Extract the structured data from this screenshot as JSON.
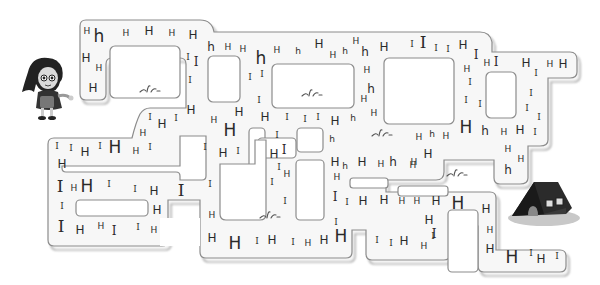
{
  "puzzle": {
    "type": "letter-maze",
    "start": "girl",
    "goal": "house",
    "path_letter": "H",
    "distractor_letters": [
      "h",
      "I"
    ]
  },
  "colors": {
    "corridor_fill": "#f8f8f8",
    "corridor_edge": "#8a8a8a",
    "shadow": "#b9b9b9",
    "letter": "#2a2a2a"
  },
  "letters": [
    {
      "c": "H",
      "x": 87,
      "y": 31,
      "s": "s"
    },
    {
      "c": "h",
      "x": 99,
      "y": 36,
      "s": "l",
      "t": "lower"
    },
    {
      "c": "H",
      "x": 126,
      "y": 33,
      "s": "s"
    },
    {
      "c": "H",
      "x": 149,
      "y": 31,
      "s": "m"
    },
    {
      "c": "H",
      "x": 172,
      "y": 33,
      "s": "s"
    },
    {
      "c": "H",
      "x": 193,
      "y": 35,
      "s": "m"
    },
    {
      "c": "H",
      "x": 86,
      "y": 58,
      "s": "m"
    },
    {
      "c": "H",
      "x": 99,
      "y": 68,
      "s": "s"
    },
    {
      "c": "H",
      "x": 93,
      "y": 88,
      "s": "m"
    },
    {
      "c": "I",
      "x": 188,
      "y": 57,
      "s": "s",
      "t": "serif"
    },
    {
      "c": "I",
      "x": 196,
      "y": 62,
      "s": "m",
      "t": "serif"
    },
    {
      "c": "I",
      "x": 190,
      "y": 80,
      "s": "s",
      "t": "serif"
    },
    {
      "c": "H",
      "x": 191,
      "y": 110,
      "s": "m"
    },
    {
      "c": "I",
      "x": 150,
      "y": 117,
      "s": "s",
      "t": "serif"
    },
    {
      "c": "H",
      "x": 162,
      "y": 124,
      "s": "m"
    },
    {
      "c": "I",
      "x": 176,
      "y": 118,
      "s": "s",
      "t": "serif"
    },
    {
      "c": "H",
      "x": 143,
      "y": 133,
      "s": "s"
    },
    {
      "c": "h",
      "x": 211,
      "y": 47,
      "s": "m",
      "t": "lower"
    },
    {
      "c": "H",
      "x": 228,
      "y": 47,
      "s": "s"
    },
    {
      "c": "H",
      "x": 243,
      "y": 49,
      "s": "s"
    },
    {
      "c": "h",
      "x": 261,
      "y": 58,
      "s": "l",
      "t": "lower"
    },
    {
      "c": "H",
      "x": 277,
      "y": 50,
      "s": "s"
    },
    {
      "c": "h",
      "x": 298,
      "y": 51,
      "s": "s",
      "t": "lower"
    },
    {
      "c": "H",
      "x": 319,
      "y": 44,
      "s": "m"
    },
    {
      "c": "H",
      "x": 333,
      "y": 55,
      "s": "s"
    },
    {
      "c": "h",
      "x": 345,
      "y": 51,
      "s": "s",
      "t": "lower"
    },
    {
      "c": "H",
      "x": 356,
      "y": 41,
      "s": "s"
    },
    {
      "c": "h",
      "x": 365,
      "y": 52,
      "s": "m",
      "t": "lower"
    },
    {
      "c": "H",
      "x": 384,
      "y": 47,
      "s": "m"
    },
    {
      "c": "I",
      "x": 250,
      "y": 77,
      "s": "s",
      "t": "serif"
    },
    {
      "c": "I",
      "x": 262,
      "y": 74,
      "s": "s",
      "t": "serif"
    },
    {
      "c": "I",
      "x": 259,
      "y": 100,
      "s": "s",
      "t": "serif"
    },
    {
      "c": "H",
      "x": 367,
      "y": 70,
      "s": "s"
    },
    {
      "c": "h",
      "x": 371,
      "y": 89,
      "s": "m",
      "t": "lower"
    },
    {
      "c": "H",
      "x": 364,
      "y": 99,
      "s": "s"
    },
    {
      "c": "H",
      "x": 374,
      "y": 113,
      "s": "s"
    },
    {
      "c": "H",
      "x": 214,
      "y": 120,
      "s": "s"
    },
    {
      "c": "H",
      "x": 239,
      "y": 112,
      "s": "m"
    },
    {
      "c": "H",
      "x": 265,
      "y": 117,
      "s": "m"
    },
    {
      "c": "I",
      "x": 287,
      "y": 117,
      "s": "s",
      "t": "serif"
    },
    {
      "c": "I",
      "x": 305,
      "y": 119,
      "s": "s",
      "t": "serif"
    },
    {
      "c": "I",
      "x": 318,
      "y": 117,
      "s": "s",
      "t": "serif"
    },
    {
      "c": "H",
      "x": 335,
      "y": 121,
      "s": "m"
    },
    {
      "c": "h",
      "x": 353,
      "y": 118,
      "s": "s",
      "t": "lower"
    },
    {
      "c": "H",
      "x": 230,
      "y": 130,
      "s": "l"
    },
    {
      "c": "I",
      "x": 277,
      "y": 135,
      "s": "s",
      "t": "serif"
    },
    {
      "c": "h",
      "x": 332,
      "y": 139,
      "s": "s",
      "t": "lower"
    },
    {
      "c": "I",
      "x": 412,
      "y": 44,
      "s": "s",
      "t": "serif"
    },
    {
      "c": "I",
      "x": 423,
      "y": 42,
      "s": "l",
      "t": "serif"
    },
    {
      "c": "I",
      "x": 436,
      "y": 48,
      "s": "s",
      "t": "serif"
    },
    {
      "c": "I",
      "x": 448,
      "y": 49,
      "s": "s",
      "t": "serif"
    },
    {
      "c": "H",
      "x": 463,
      "y": 45,
      "s": "m"
    },
    {
      "c": "I",
      "x": 476,
      "y": 55,
      "s": "m",
      "t": "serif"
    },
    {
      "c": "H",
      "x": 467,
      "y": 69,
      "s": "s"
    },
    {
      "c": "H",
      "x": 487,
      "y": 63,
      "s": "s"
    },
    {
      "c": "I",
      "x": 496,
      "y": 62,
      "s": "m",
      "t": "serif"
    },
    {
      "c": "I",
      "x": 470,
      "y": 82,
      "s": "s",
      "t": "serif"
    },
    {
      "c": "I",
      "x": 466,
      "y": 100,
      "s": "s",
      "t": "serif"
    },
    {
      "c": "I",
      "x": 480,
      "y": 104,
      "s": "s",
      "t": "serif"
    },
    {
      "c": "H",
      "x": 526,
      "y": 63,
      "s": "m"
    },
    {
      "c": "I",
      "x": 536,
      "y": 73,
      "s": "s",
      "t": "serif"
    },
    {
      "c": "H",
      "x": 550,
      "y": 64,
      "s": "s"
    },
    {
      "c": "H",
      "x": 563,
      "y": 64,
      "s": "m"
    },
    {
      "c": "I",
      "x": 531,
      "y": 93,
      "s": "s",
      "t": "serif"
    },
    {
      "c": "I",
      "x": 527,
      "y": 108,
      "s": "s",
      "t": "serif"
    },
    {
      "c": "I",
      "x": 539,
      "y": 117,
      "s": "s",
      "t": "serif"
    },
    {
      "c": "H",
      "x": 466,
      "y": 127,
      "s": "l"
    },
    {
      "c": "h",
      "x": 485,
      "y": 131,
      "s": "m",
      "t": "lower"
    },
    {
      "c": "H",
      "x": 504,
      "y": 132,
      "s": "s"
    },
    {
      "c": "H",
      "x": 520,
      "y": 130,
      "s": "m"
    },
    {
      "c": "I",
      "x": 535,
      "y": 132,
      "s": "s",
      "t": "serif"
    },
    {
      "c": "H",
      "x": 419,
      "y": 137,
      "s": "s"
    },
    {
      "c": "h",
      "x": 432,
      "y": 134,
      "s": "s",
      "t": "lower"
    },
    {
      "c": "H",
      "x": 446,
      "y": 136,
      "s": "s"
    },
    {
      "c": "H",
      "x": 508,
      "y": 149,
      "s": "s"
    },
    {
      "c": "H",
      "x": 521,
      "y": 159,
      "s": "s"
    },
    {
      "c": "h",
      "x": 508,
      "y": 170,
      "s": "m",
      "t": "lower"
    },
    {
      "c": "I",
      "x": 57,
      "y": 146,
      "s": "s",
      "t": "serif"
    },
    {
      "c": "I",
      "x": 71,
      "y": 148,
      "s": "s",
      "t": "serif"
    },
    {
      "c": "H",
      "x": 85,
      "y": 152,
      "s": "m"
    },
    {
      "c": "I",
      "x": 100,
      "y": 146,
      "s": "s",
      "t": "serif"
    },
    {
      "c": "H",
      "x": 115,
      "y": 147,
      "s": "l"
    },
    {
      "c": "H",
      "x": 136,
      "y": 151,
      "s": "s"
    },
    {
      "c": "I",
      "x": 150,
      "y": 147,
      "s": "s",
      "t": "serif"
    },
    {
      "c": "H",
      "x": 62,
      "y": 164,
      "s": "m"
    },
    {
      "c": "I",
      "x": 60,
      "y": 186,
      "s": "l",
      "t": "serif"
    },
    {
      "c": "H",
      "x": 74,
      "y": 188,
      "s": "s"
    },
    {
      "c": "H",
      "x": 87,
      "y": 186,
      "s": "l"
    },
    {
      "c": "I",
      "x": 109,
      "y": 184,
      "s": "s",
      "t": "serif"
    },
    {
      "c": "I",
      "x": 135,
      "y": 189,
      "s": "s",
      "t": "serif"
    },
    {
      "c": "H",
      "x": 154,
      "y": 191,
      "s": "m"
    },
    {
      "c": "I",
      "x": 181,
      "y": 190,
      "s": "l",
      "t": "serif"
    },
    {
      "c": "I",
      "x": 62,
      "y": 206,
      "s": "s",
      "t": "serif"
    },
    {
      "c": "H",
      "x": 157,
      "y": 210,
      "s": "m"
    },
    {
      "c": "I",
      "x": 61,
      "y": 226,
      "s": "l",
      "t": "serif"
    },
    {
      "c": "H",
      "x": 80,
      "y": 230,
      "s": "m"
    },
    {
      "c": "H",
      "x": 101,
      "y": 226,
      "s": "s"
    },
    {
      "c": "I",
      "x": 114,
      "y": 231,
      "s": "m",
      "t": "serif"
    },
    {
      "c": "I",
      "x": 138,
      "y": 227,
      "s": "s",
      "t": "serif"
    },
    {
      "c": "H",
      "x": 154,
      "y": 230,
      "s": "s"
    },
    {
      "c": "I",
      "x": 205,
      "y": 147,
      "s": "s",
      "t": "serif"
    },
    {
      "c": "I",
      "x": 210,
      "y": 184,
      "s": "s",
      "t": "serif"
    },
    {
      "c": "H",
      "x": 223,
      "y": 153,
      "s": "m"
    },
    {
      "c": "I",
      "x": 238,
      "y": 151,
      "s": "s",
      "t": "serif"
    },
    {
      "c": "H",
      "x": 274,
      "y": 154,
      "s": "m"
    },
    {
      "c": "I",
      "x": 284,
      "y": 150,
      "s": "m",
      "t": "serif"
    },
    {
      "c": "I",
      "x": 279,
      "y": 167,
      "s": "s",
      "t": "serif"
    },
    {
      "c": "H",
      "x": 287,
      "y": 174,
      "s": "s"
    },
    {
      "c": "I",
      "x": 272,
      "y": 182,
      "s": "s",
      "t": "serif"
    },
    {
      "c": "I",
      "x": 285,
      "y": 201,
      "s": "s",
      "t": "serif"
    },
    {
      "c": "H",
      "x": 212,
      "y": 215,
      "s": "s"
    },
    {
      "c": "H",
      "x": 212,
      "y": 238,
      "s": "m"
    },
    {
      "c": "H",
      "x": 235,
      "y": 243,
      "s": "l"
    },
    {
      "c": "I",
      "x": 257,
      "y": 241,
      "s": "s",
      "t": "serif"
    },
    {
      "c": "H",
      "x": 272,
      "y": 240,
      "s": "m"
    },
    {
      "c": "I",
      "x": 293,
      "y": 242,
      "s": "s",
      "t": "serif"
    },
    {
      "c": "H",
      "x": 308,
      "y": 243,
      "s": "s"
    },
    {
      "c": "H",
      "x": 324,
      "y": 240,
      "s": "m"
    },
    {
      "c": "H",
      "x": 341,
      "y": 236,
      "s": "l"
    },
    {
      "c": "I",
      "x": 336,
      "y": 222,
      "s": "s",
      "t": "serif"
    },
    {
      "c": "I",
      "x": 335,
      "y": 197,
      "s": "m",
      "t": "serif"
    },
    {
      "c": "I",
      "x": 347,
      "y": 202,
      "s": "s",
      "t": "serif"
    },
    {
      "c": "H",
      "x": 363,
      "y": 201,
      "s": "m"
    },
    {
      "c": "H",
      "x": 384,
      "y": 200,
      "s": "m"
    },
    {
      "c": "H",
      "x": 337,
      "y": 177,
      "s": "s"
    },
    {
      "c": "H",
      "x": 335,
      "y": 162,
      "s": "m"
    },
    {
      "c": "h",
      "x": 345,
      "y": 166,
      "s": "s",
      "t": "lower"
    },
    {
      "c": "H",
      "x": 362,
      "y": 162,
      "s": "m"
    },
    {
      "c": "H",
      "x": 381,
      "y": 164,
      "s": "s"
    },
    {
      "c": "h",
      "x": 393,
      "y": 162,
      "s": "m",
      "t": "lower"
    },
    {
      "c": "H",
      "x": 414,
      "y": 162,
      "s": "s"
    },
    {
      "c": "H",
      "x": 428,
      "y": 154,
      "s": "m"
    },
    {
      "c": "H",
      "x": 413,
      "y": 165,
      "s": "s"
    },
    {
      "c": "I",
      "x": 377,
      "y": 240,
      "s": "s",
      "t": "serif"
    },
    {
      "c": "I",
      "x": 391,
      "y": 243,
      "s": "s",
      "t": "serif"
    },
    {
      "c": "H",
      "x": 404,
      "y": 241,
      "s": "m"
    },
    {
      "c": "I",
      "x": 433,
      "y": 236,
      "s": "s",
      "t": "serif"
    },
    {
      "c": "H",
      "x": 424,
      "y": 246,
      "s": "s"
    },
    {
      "c": "H",
      "x": 402,
      "y": 201,
      "s": "s"
    },
    {
      "c": "H",
      "x": 417,
      "y": 201,
      "s": "s"
    },
    {
      "c": "H",
      "x": 436,
      "y": 201,
      "s": "m"
    },
    {
      "c": "H",
      "x": 458,
      "y": 203,
      "s": "l"
    },
    {
      "c": "H",
      "x": 429,
      "y": 220,
      "s": "m"
    },
    {
      "c": "I",
      "x": 434,
      "y": 234,
      "s": "m",
      "t": "serif"
    },
    {
      "c": "H",
      "x": 486,
      "y": 209,
      "s": "m"
    },
    {
      "c": "H",
      "x": 490,
      "y": 230,
      "s": "s"
    },
    {
      "c": "H",
      "x": 490,
      "y": 249,
      "s": "m"
    },
    {
      "c": "H",
      "x": 512,
      "y": 257,
      "s": "l"
    },
    {
      "c": "I",
      "x": 531,
      "y": 253,
      "s": "s",
      "t": "serif"
    },
    {
      "c": "H",
      "x": 541,
      "y": 259,
      "s": "m"
    },
    {
      "c": "I",
      "x": 557,
      "y": 256,
      "s": "s",
      "t": "serif"
    }
  ]
}
